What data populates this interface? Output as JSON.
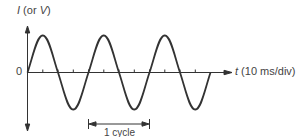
{
  "diagram": {
    "y_axis": {
      "symbol": "I",
      "paren_open": " (or ",
      "alt_symbol": "V",
      "paren_close": ")"
    },
    "x_axis": {
      "symbol": "t",
      "units": " (10 ms/div)"
    },
    "origin_label": "0",
    "cycle_label": "1 cycle",
    "cycles_shown": 3,
    "period_divisions": 4,
    "wave_color": "#333333"
  }
}
